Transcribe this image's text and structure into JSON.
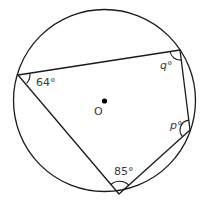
{
  "diagram": {
    "type": "cyclic-quadrilateral",
    "circle": {
      "cx": 104.5,
      "cy": 100.5,
      "r": 91
    },
    "center": {
      "label": "O",
      "x": 104,
      "y": 102
    },
    "vertices": [
      {
        "id": "A",
        "x": 18,
        "y": 75
      },
      {
        "id": "B",
        "x": 180,
        "y": 50
      },
      {
        "id": "C",
        "x": 190,
        "y": 130
      },
      {
        "id": "D",
        "x": 119,
        "y": 194
      }
    ],
    "angles": [
      {
        "vertex": "A",
        "label": "64°",
        "value": 64
      },
      {
        "vertex": "B",
        "label": "q°",
        "value": null
      },
      {
        "vertex": "C",
        "label": "p°",
        "value": null
      },
      {
        "vertex": "D",
        "label": "85°",
        "value": 85
      }
    ],
    "stroke_color": "#1a1a1a",
    "label_color": "#3a3a3a"
  }
}
